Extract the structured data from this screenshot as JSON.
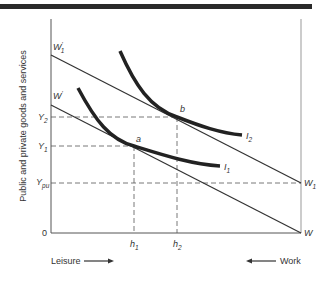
{
  "diagram": {
    "title": "",
    "y_axis_label": "Public and private goods and services",
    "origin_label": "0",
    "x_axis_labels": {
      "left": "Leisure",
      "right": "Work"
    },
    "budget_lines": [
      {
        "name": "W'1",
        "label_main": "W",
        "label_sup": "'",
        "label_sub": "1",
        "from": "left intercept (high)",
        "to": "W1"
      },
      {
        "name": "W'",
        "label_main": "W",
        "label_sup": "'",
        "label_sub": "",
        "from": "left intercept (low)",
        "to": "W"
      }
    ],
    "right_axis_points": {
      "W1": {
        "main": "W",
        "sub": "1"
      },
      "W": {
        "main": "W",
        "sub": ""
      }
    },
    "indifference_curves": [
      {
        "name": "I1",
        "main": "I",
        "sub": "1",
        "tangent_point": "a"
      },
      {
        "name": "I2",
        "main": "I",
        "sub": "2",
        "tangent_point": "b"
      }
    ],
    "points": {
      "a": "a",
      "b": "b"
    },
    "y_levels": {
      "Y2": {
        "main": "Y",
        "sub": "2"
      },
      "Y1": {
        "main": "Y",
        "sub": "1"
      },
      "Ypu": {
        "main": "Y",
        "sub": "pu"
      }
    },
    "x_levels": {
      "h1": {
        "main": "h",
        "sub": "1"
      },
      "h2": {
        "main": "h",
        "sub": "2"
      }
    }
  }
}
